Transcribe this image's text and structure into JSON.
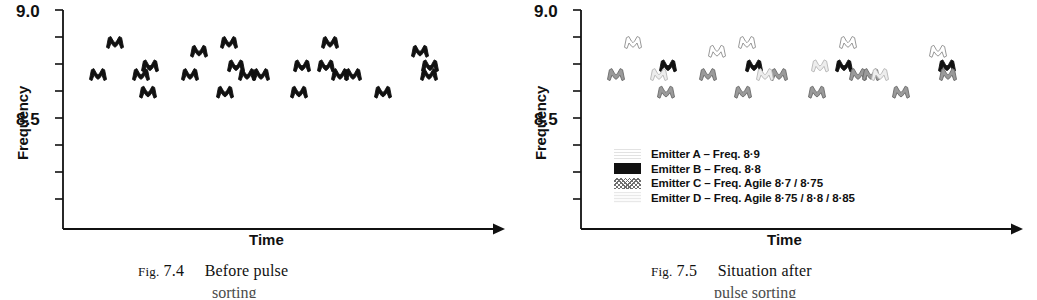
{
  "figure_left": {
    "caption_prefix": "Fig.",
    "caption_number": "7.4",
    "caption_text": "Before pulse",
    "caption_line2": "sorting",
    "axis": {
      "ylabel": "Frequency",
      "xlabel": "Time",
      "yticks_labeled": [
        "9.0",
        "8.5"
      ]
    }
  },
  "figure_right": {
    "caption_prefix": "Fig.",
    "caption_number": "7.5",
    "caption_text": "Situation after",
    "caption_line2": "pulse sorting",
    "axis": {
      "ylabel": "Frequency",
      "xlabel": "Time",
      "yticks_labeled": [
        "9.0",
        "8.5"
      ]
    },
    "legend": [
      {
        "id": "A",
        "label": "Emitter A – Freq. 8·9",
        "swatch": "sw-A",
        "color": "#ffffff"
      },
      {
        "id": "B",
        "label": "Emitter B – Freq. 8·8",
        "swatch": "sw-B",
        "color": "#111111"
      },
      {
        "id": "C",
        "label": "Emitter C – Freq. Agile 8·7 / 8·75",
        "swatch": "sw-C",
        "color": "#8a8a8a"
      },
      {
        "id": "D",
        "label": "Emitter D – Freq. Agile 8·75 / 8·8 / 8·85",
        "swatch": "sw-D",
        "color": "#e6e6e6"
      }
    ]
  },
  "chart_data": [
    {
      "type": "scatter",
      "title": "Fig. 7.4  Before pulse sorting",
      "xlabel": "Time",
      "ylabel": "Frequency",
      "ylim": [
        8.25,
        9.0
      ],
      "yticks": [
        9.0,
        8.5
      ],
      "grid": false,
      "legend": "none",
      "marker": "pulse-glyph",
      "note": "All pulses drawn in a single solid-black (unsorted) style.",
      "series": [
        {
          "name": "Unsorted pulse train",
          "fill": "#111111",
          "points": [
            {
              "x": 28,
              "y": 8.78
            },
            {
              "x": 45,
              "y": 8.89
            },
            {
              "x": 71,
              "y": 8.78
            },
            {
              "x": 80,
              "y": 8.81
            },
            {
              "x": 78,
              "y": 8.72
            },
            {
              "x": 120,
              "y": 8.78
            },
            {
              "x": 129,
              "y": 8.86
            },
            {
              "x": 159,
              "y": 8.89
            },
            {
              "x": 155,
              "y": 8.72
            },
            {
              "x": 166,
              "y": 8.81
            },
            {
              "x": 177,
              "y": 8.78
            },
            {
              "x": 191,
              "y": 8.78
            },
            {
              "x": 232,
              "y": 8.81
            },
            {
              "x": 229,
              "y": 8.72
            },
            {
              "x": 260,
              "y": 8.89
            },
            {
              "x": 256,
              "y": 8.81
            },
            {
              "x": 270,
              "y": 8.78
            },
            {
              "x": 283,
              "y": 8.78
            },
            {
              "x": 313,
              "y": 8.72
            },
            {
              "x": 350,
              "y": 8.86
            },
            {
              "x": 360,
              "y": 8.81
            },
            {
              "x": 359,
              "y": 8.78
            }
          ]
        }
      ]
    },
    {
      "type": "scatter",
      "title": "Fig. 7.5  Situation after pulse sorting",
      "xlabel": "Time",
      "ylabel": "Frequency",
      "ylim": [
        8.25,
        9.0
      ],
      "yticks": [
        9.0,
        8.5
      ],
      "grid": false,
      "legend": "inside-lower-left",
      "marker": "pulse-glyph",
      "note": "Same pulse train as Fig 7.4 but each pulse shaded by emitter.",
      "series": [
        {
          "name": "Emitter A – Freq. 8·9",
          "fill": "#ffffff",
          "stroke": "#8c8c8c",
          "points": [
            {
              "x": 45,
              "y": 8.89
            },
            {
              "x": 129,
              "y": 8.86
            },
            {
              "x": 159,
              "y": 8.89
            },
            {
              "x": 260,
              "y": 8.89
            },
            {
              "x": 350,
              "y": 8.86
            }
          ]
        },
        {
          "name": "Emitter B – Freq. 8·8",
          "fill": "#111111",
          "stroke": "#111111",
          "points": [
            {
              "x": 80,
              "y": 8.81
            },
            {
              "x": 166,
              "y": 8.81
            },
            {
              "x": 256,
              "y": 8.81
            },
            {
              "x": 359,
              "y": 8.81
            }
          ]
        },
        {
          "name": "Emitter C – Freq. Agile 8·7 / 8·75",
          "fill": "#9a9a9a",
          "stroke": "#6a6a6a",
          "points": [
            {
              "x": 28,
              "y": 8.78
            },
            {
              "x": 78,
              "y": 8.72
            },
            {
              "x": 120,
              "y": 8.78
            },
            {
              "x": 155,
              "y": 8.72
            },
            {
              "x": 191,
              "y": 8.78
            },
            {
              "x": 229,
              "y": 8.72
            },
            {
              "x": 270,
              "y": 8.78
            },
            {
              "x": 283,
              "y": 8.78
            },
            {
              "x": 313,
              "y": 8.72
            },
            {
              "x": 360,
              "y": 8.78
            }
          ]
        },
        {
          "name": "Emitter D – Freq. Agile 8·75 / 8·8 / 8·85",
          "fill": "#ededed",
          "stroke": "#b5b5b5",
          "points": [
            {
              "x": 71,
              "y": 8.78
            },
            {
              "x": 177,
              "y": 8.78
            },
            {
              "x": 232,
              "y": 8.81
            },
            {
              "x": 292,
              "y": 8.78
            }
          ]
        }
      ]
    }
  ]
}
